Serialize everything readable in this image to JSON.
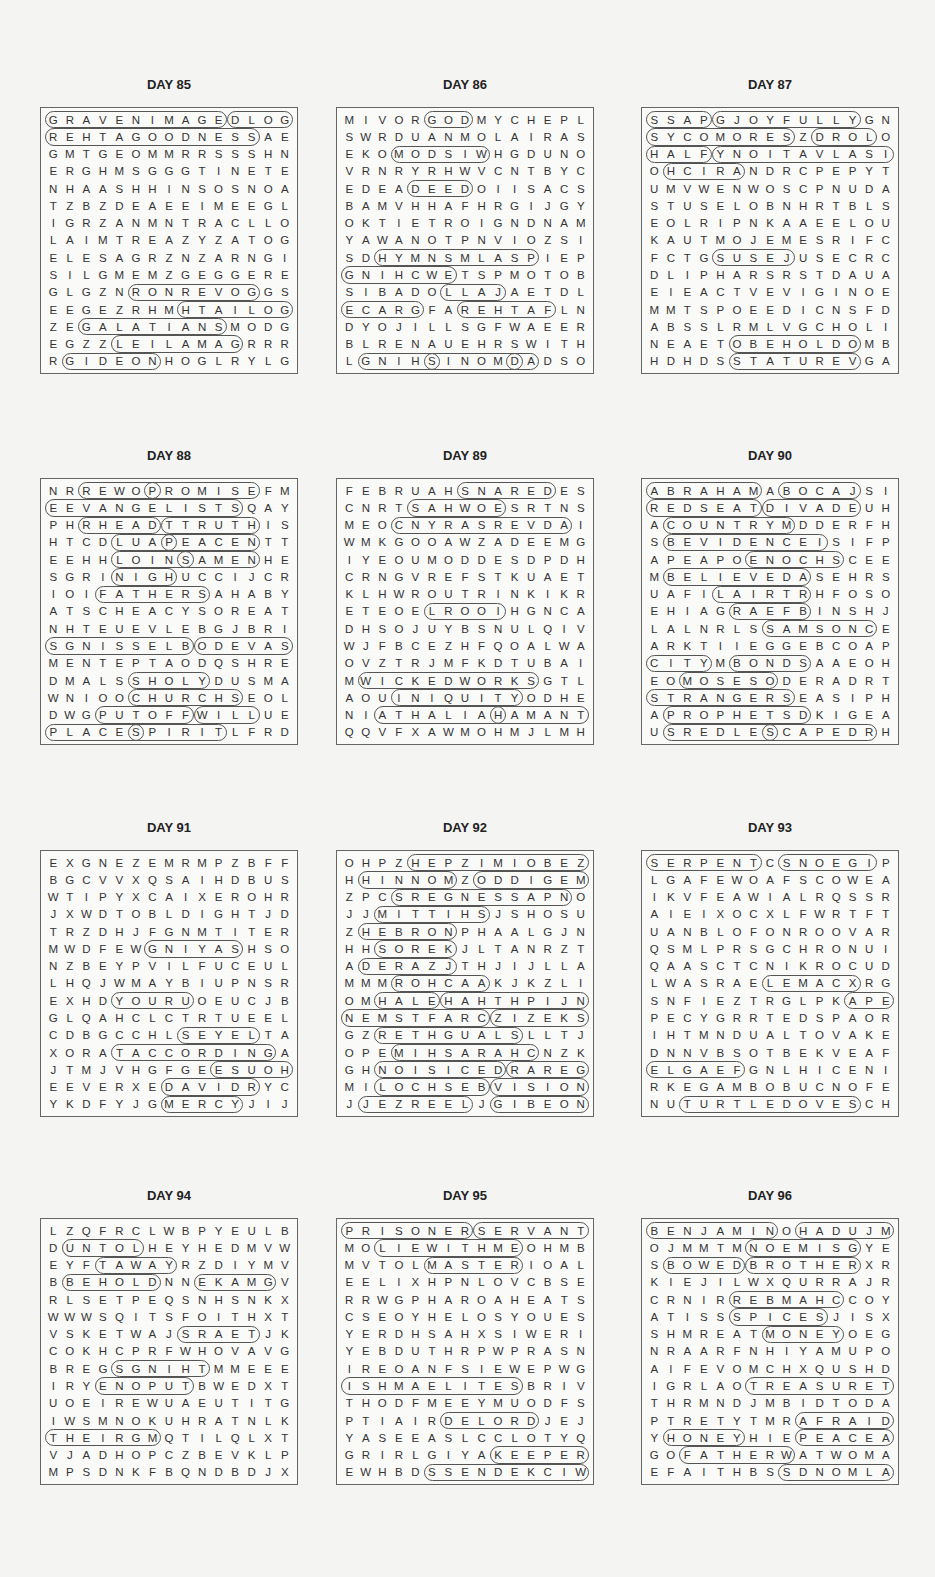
{
  "puzzles": [
    {
      "title": "DAY 85",
      "rows": [
        "GRAVENIMAGEDLOG",
        "REHTAGOODNESSAE",
        "GMTGEOMMRRSSSHN",
        "ERGHMSGGGTINETE",
        "NHAASHHINSOSNOA",
        "TZBZDEAEEIMEEGL",
        "IGRZANMNTRACLLO",
        "LAIMTREAZYZATOG",
        "ELESAGRZNZARNGI",
        "SILGMEMZGEGGERE",
        "GLGZNRONREVOGGS",
        "EEGEZRHMHTAILOG",
        "ZEGALATIANSMODG",
        "EGZZLEILAMAGRRR",
        "RGIDEONHOGLRYLG"
      ],
      "h": [
        [
          0,
          0,
          11
        ],
        [
          0,
          11,
          4
        ],
        [
          1,
          0,
          13
        ],
        [
          10,
          5,
          8
        ],
        [
          11,
          8,
          7
        ],
        [
          12,
          2,
          9
        ],
        [
          13,
          4,
          8
        ],
        [
          14,
          1,
          6
        ]
      ]
    },
    {
      "title": "DAY 86",
      "rows": [
        "MIVORGODMYCHEPL",
        "SWRDUANMOLAIRAS",
        "EKOMODSIWHGDUNO",
        "VRNRYRHWVCNTBYC",
        "EDEADEEDOIISACS",
        "BAMVHHAFHRGIJGY",
        "OKTIETROIGNDNAM",
        "YAWANOTPNVIOZSI",
        "SDHYMNSMLASPIEP",
        "GNIHCWETSPMOTOB",
        "SIBADOLLAJAETDL",
        "ECARGFAREHTAFLN",
        "DYOJILLSGFWAEER",
        "BLRENAUEHRSWITH",
        "LGNIHSINOMDADSO"
      ],
      "h": [
        [
          0,
          5,
          3
        ],
        [
          2,
          3,
          6
        ],
        [
          4,
          4,
          4
        ],
        [
          8,
          2,
          10
        ],
        [
          9,
          0,
          7
        ],
        [
          10,
          6,
          4
        ],
        [
          11,
          0,
          5
        ],
        [
          11,
          7,
          6
        ],
        [
          14,
          1,
          5
        ],
        [
          14,
          5,
          6
        ],
        [
          14,
          10,
          2
        ]
      ]
    },
    {
      "title": "DAY 87",
      "rows": [
        "SSAPGJOYFULLYGN",
        "SYCOMORESZDROLO",
        "HALFYNOITAVLASI",
        "OHCIRANDRCPEPYT",
        "UMVWENWOSCPNUDA",
        "STUSELOBNHRTBLS",
        "EOLRIPNKAAEELOU",
        "KAUTMOJEMESRIFC",
        "FCTGSUSEJUSECRC",
        "DLIPHARSRSTDAUA",
        "EIEACTVEVIGINOE",
        "MMTSPOEEDICNSFD",
        "ABSSLRMLVGCHOLI",
        "NEAETOBEHOLDOMB",
        "HDHDSSTATUREVGA"
      ],
      "h": [
        [
          0,
          0,
          4
        ],
        [
          0,
          4,
          9
        ],
        [
          1,
          0,
          9
        ],
        [
          1,
          10,
          4
        ],
        [
          2,
          0,
          4
        ],
        [
          2,
          4,
          11
        ],
        [
          3,
          1,
          5
        ],
        [
          8,
          4,
          5
        ],
        [
          13,
          5,
          8
        ],
        [
          14,
          5,
          8
        ]
      ]
    },
    {
      "title": "DAY 88",
      "rows": [
        "NRREWOPROMISEFM",
        "EEVANGELISTSQAY",
        "PHRHEADTTRUTHIS",
        "HTCDLUAPEACENTT",
        "EEHHLOINSAMENHE",
        "SGRINIGHUCCIJCR",
        "IOIFATHERSAHABY",
        "ATSCHEACYSOREAT",
        "NHTEUEVLEBGJBRI",
        "SGNISSELBODEVAS",
        "MENTEPTAODQSHRE",
        "DMALSSHOLYDUSMA",
        "WNIOOCHURCHSEOL",
        "DWGPUTOFFWILLUE",
        "PLACESPIRITLFRD"
      ],
      "h": [
        [
          0,
          2,
          5
        ],
        [
          0,
          6,
          7
        ],
        [
          1,
          0,
          12
        ],
        [
          2,
          2,
          5
        ],
        [
          2,
          7,
          6
        ],
        [
          3,
          4,
          4
        ],
        [
          3,
          7,
          6
        ],
        [
          4,
          4,
          5
        ],
        [
          4,
          8,
          5
        ],
        [
          5,
          4,
          4
        ],
        [
          6,
          3,
          7
        ],
        [
          9,
          0,
          9
        ],
        [
          9,
          9,
          6
        ],
        [
          11,
          5,
          5
        ],
        [
          12,
          5,
          7
        ],
        [
          13,
          3,
          6
        ],
        [
          13,
          9,
          4
        ],
        [
          14,
          0,
          6
        ],
        [
          14,
          5,
          6
        ]
      ]
    },
    {
      "title": "DAY 89",
      "rows": [
        "FEBRUAHSNAREDES",
        "CNRTSAHWOESRTNS",
        "MEOCNYRASREVDAI",
        "WMKGOOAWZADEEMG",
        "IYEOUMODDESDPDH",
        "CRNGVREFSTKUAET",
        "KLHWROUTRINKIKR",
        "ETEOELROOIHGNCA",
        "DHSOJUYBSNULQIV",
        "WJFBCEZHFQOALWA",
        "OVZTRJMFKDTUBAI",
        "MWICKEDWORKSGTL",
        "AOUINIQUITYODHE",
        "NIATHALIAHAMANT",
        "QQVFXAWMOHMJLMH"
      ],
      "h": [
        [
          0,
          7,
          6
        ],
        [
          1,
          4,
          6
        ],
        [
          2,
          3,
          11
        ],
        [
          7,
          5,
          5
        ],
        [
          11,
          1,
          11
        ],
        [
          12,
          3,
          8
        ],
        [
          13,
          2,
          8
        ],
        [
          13,
          9,
          6
        ]
      ]
    },
    {
      "title": "DAY 90",
      "rows": [
        "ABRAHAMABOCAJSI",
        "REDSEATDIVADEUH",
        "ACOUNTRYMDDERFH",
        "SBEVIDENCEISIFP",
        "APEAPOENOCHSCEE",
        "MBELIEVEDASEHRS",
        "UAFILAIRTRHFOSO",
        "EHIAGRAEFBINSHJ",
        "LALNRLSSAMSONCE",
        "ARKTIIEGGEBCOAP",
        "CITYMBONDSAAEOH",
        "EOMOSESODERADRT",
        "STRANGERSEASIPH",
        "APROPHETSDKIGEA",
        "USREDLESCAPEDRH"
      ],
      "h": [
        [
          0,
          0,
          7
        ],
        [
          0,
          8,
          5
        ],
        [
          1,
          0,
          7
        ],
        [
          1,
          7,
          6
        ],
        [
          2,
          1,
          8
        ],
        [
          3,
          1,
          10
        ],
        [
          4,
          6,
          6
        ],
        [
          5,
          1,
          9
        ],
        [
          6,
          4,
          6
        ],
        [
          7,
          5,
          5
        ],
        [
          8,
          7,
          7
        ],
        [
          10,
          0,
          4
        ],
        [
          10,
          5,
          5
        ],
        [
          11,
          2,
          6
        ],
        [
          12,
          0,
          9
        ],
        [
          13,
          1,
          9
        ],
        [
          14,
          1,
          7
        ],
        [
          14,
          7,
          7
        ]
      ]
    },
    {
      "title": "DAY 91",
      "rows": [
        "EXGNEZEMRMPZBFF",
        "BGCVVXQSAIHDBUS",
        "WTIPYXCAIXEROHR",
        "JXWDTOBLDIGHTJD",
        "TRZDHJFGNMTITER",
        "MWDFEWGNIYASHSO",
        "NZBEYPVILFUCEUL",
        "LHQJWMAYBIUPNSR",
        "EXHDYOURUOEUCJB",
        "GLQAHCLCTRTUEEL",
        "CDBGCCHLSEYELTA",
        "XORATACCORDINGA",
        "JTMJVHGFGEESUOH",
        "EEVERXEDAVIDRYC",
        "YKDFYJGMERCYJIJ"
      ],
      "h": [
        [
          5,
          6,
          6
        ],
        [
          8,
          4,
          5
        ],
        [
          10,
          8,
          5
        ],
        [
          11,
          4,
          10
        ],
        [
          12,
          10,
          5
        ],
        [
          13,
          7,
          6
        ],
        [
          14,
          7,
          5
        ]
      ]
    },
    {
      "title": "DAY 92",
      "rows": [
        "OHPZHEPZIMIOBEZ",
        "HHINNOMZODDIGEM",
        "ZPCSREGNESSAPNO",
        "JJMITTIHSJSHOSU",
        "ZHEBRONPHAALGJN",
        "HHSOREKJLTANRZT",
        "ADERAZJTHJIJLLA",
        "MMMROHCAAKJKZLI",
        "OMHALEHAHTHPIJN",
        "NEMSTFARCZIZEKS",
        "GZRETHGUALSLLTJ",
        "OPEMIHSARAHCNZK",
        "GHNOISICEDRAREG",
        "MILOCHSEBVISION",
        "JJEZREELJGIBEON"
      ],
      "h": [
        [
          0,
          4,
          11
        ],
        [
          1,
          1,
          6
        ],
        [
          1,
          8,
          7
        ],
        [
          2,
          3,
          11
        ],
        [
          3,
          2,
          7
        ],
        [
          4,
          1,
          6
        ],
        [
          5,
          2,
          5
        ],
        [
          6,
          1,
          6
        ],
        [
          7,
          3,
          6
        ],
        [
          8,
          2,
          4
        ],
        [
          8,
          6,
          9
        ],
        [
          9,
          0,
          9
        ],
        [
          9,
          9,
          6
        ],
        [
          10,
          2,
          9
        ],
        [
          11,
          3,
          9
        ],
        [
          12,
          2,
          8
        ],
        [
          12,
          10,
          5
        ],
        [
          13,
          2,
          7
        ],
        [
          13,
          9,
          6
        ],
        [
          14,
          1,
          7
        ],
        [
          14,
          9,
          6
        ]
      ]
    },
    {
      "title": "DAY 93",
      "rows": [
        "SERPENTCSNOEGIP",
        "LGAFEWOAFSCOWEA",
        "IKVFEAWIALRQSSR",
        "AIEIXOCXLFWRTFT",
        "UANBLOFONROOVAR",
        "QSMLPRSGCHRONUI",
        "QAASCTCNIKROCUD",
        "LWASRAELEMACXRG",
        "SNFIEZTRGLPKAPE",
        "PECYGRRTEDSPAOR",
        "IHTMNDUALTOVAKE",
        "DNNVBSOTBEKVEAF",
        "ELGAEFGNLHICENI",
        "RKEGAMBOBUCNOFE",
        "NUTURTLEDOVESCH"
      ],
      "h": [
        [
          0,
          0,
          7
        ],
        [
          0,
          8,
          6
        ],
        [
          7,
          7,
          6
        ],
        [
          8,
          12,
          3
        ],
        [
          12,
          0,
          6
        ],
        [
          14,
          2,
          11
        ]
      ]
    },
    {
      "title": "DAY 94",
      "rows": [
        "LZQFRCLWBPYEULB",
        "DUNTOLHEYHEDMVW",
        "EYFTAWAYRZDIYMV",
        "BBEHOLDNNEKAMGV",
        "RLSETPEQSNHSNKX",
        "WWWSQITSFOITHXT",
        "VSKETWAJSRAETJK",
        "COKHCPRFWHOVAVG",
        "BREGSGNIHTMMEEE",
        "IRYENOPUTBWEDXT",
        "UOEIREWUAEUTITG",
        "IWSMNOKUHRATNLK",
        "THEIRGMQTILQLXT",
        "VJADHOPCZBEVKLP",
        "MPSDNKFBQNDBDJX"
      ],
      "h": [
        [
          1,
          1,
          5
        ],
        [
          2,
          3,
          5
        ],
        [
          3,
          1,
          6
        ],
        [
          3,
          9,
          5
        ],
        [
          6,
          8,
          5
        ],
        [
          8,
          4,
          6
        ],
        [
          9,
          3,
          6
        ],
        [
          12,
          0,
          7
        ]
      ]
    },
    {
      "title": "DAY 95",
      "rows": [
        "PRISONERSERVANT",
        "MOLIEWITHMEOHMB",
        "MVTOLMASTERIOAL",
        "EELIXHPNLOVCBSE",
        "RRWGPHAROAHEATS",
        "CSEOYHELOSYOUES",
        "YERDHSAHXSIWERI",
        "YEBDUTHRPWPRASN",
        "IREOANFSIEWEPWG",
        "ISHMAELITESBRIV",
        "THODFMEEYMUODFS",
        "PTIAIRDELORDJEJ",
        "YASEEASLCCLOTYQ",
        "GRIRLGIYAKEEPER",
        "EWHBDSSENDEKCIW"
      ],
      "h": [
        [
          0,
          0,
          8
        ],
        [
          0,
          8,
          7
        ],
        [
          1,
          2,
          9
        ],
        [
          2,
          5,
          6
        ],
        [
          9,
          0,
          11
        ],
        [
          11,
          6,
          6
        ],
        [
          13,
          9,
          6
        ],
        [
          14,
          5,
          10
        ]
      ]
    },
    {
      "title": "DAY 96",
      "rows": [
        "BENJAMINOHADUJM",
        "OJMMTMNOEMISGYE",
        "SBOWEDBROTHERXR",
        "KIEJILWXQURRAJR",
        "CRNIRREBMAHCCOY",
        "ATISSSPICESJISX",
        "SHMREATMONEYOEG",
        "NRAARFNHIYAMUPO",
        "AIFEVOMCHXQUSHD",
        "IGRLAOTREASURET",
        "THRMNDJMBIDTODA",
        "PTRETYTMRAFRAID",
        "YHONEYHIEPEACEA",
        "GOFATHERWATWOMA",
        "EFAITHBSSDNOMLA"
      ],
      "h": [
        [
          0,
          0,
          8
        ],
        [
          0,
          9,
          6
        ],
        [
          1,
          6,
          7
        ],
        [
          2,
          1,
          5
        ],
        [
          2,
          6,
          7
        ],
        [
          4,
          5,
          7
        ],
        [
          5,
          5,
          6
        ],
        [
          6,
          7,
          5
        ],
        [
          9,
          6,
          9
        ],
        [
          11,
          9,
          6
        ],
        [
          12,
          1,
          5
        ],
        [
          12,
          9,
          6
        ],
        [
          13,
          2,
          7
        ],
        [
          14,
          8,
          7
        ]
      ]
    }
  ]
}
